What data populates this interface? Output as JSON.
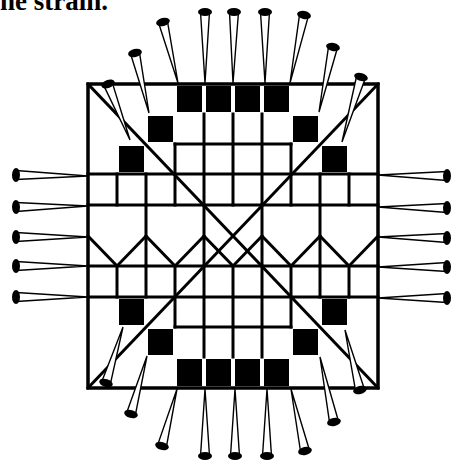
{
  "caption": {
    "text": "he strain."
  },
  "diagram": {
    "colors": {
      "line": "#000000",
      "fill": "#000000",
      "background": "#ffffff"
    },
    "outer": {
      "x0": 88,
      "y0": 84,
      "x1": 378,
      "y1": 388
    },
    "grid": {
      "cols_x": [
        88,
        117,
        146,
        175,
        204,
        233,
        262,
        291,
        320,
        349,
        378
      ],
      "rows_y": [
        84,
        114,
        144,
        174,
        205,
        236,
        266,
        297,
        327,
        357,
        388
      ]
    },
    "black_squares": [
      {
        "c": 3,
        "r": 0
      },
      {
        "c": 4,
        "r": 0
      },
      {
        "c": 5,
        "r": 0
      },
      {
        "c": 6,
        "r": 0
      },
      {
        "c": 2,
        "r": 1
      },
      {
        "c": 7,
        "r": 1
      },
      {
        "c": 1,
        "r": 2
      },
      {
        "c": 8,
        "r": 2
      },
      {
        "c": 1,
        "r": 7
      },
      {
        "c": 8,
        "r": 7
      },
      {
        "c": 2,
        "r": 8
      },
      {
        "c": 7,
        "r": 8
      },
      {
        "c": 3,
        "r": 9
      },
      {
        "c": 4,
        "r": 9
      },
      {
        "c": 5,
        "r": 9
      },
      {
        "c": 6,
        "r": 9
      }
    ],
    "segments": [
      [
        88,
        205,
        378,
        205
      ],
      [
        88,
        174,
        378,
        174
      ],
      [
        175,
        144,
        291,
        144
      ],
      [
        88,
        266,
        378,
        266
      ],
      [
        88,
        297,
        378,
        297
      ],
      [
        175,
        327,
        291,
        327
      ],
      [
        117,
        174,
        117,
        205
      ],
      [
        146,
        174,
        146,
        205
      ],
      [
        175,
        144,
        175,
        205
      ],
      [
        204,
        114,
        204,
        205
      ],
      [
        233,
        114,
        233,
        205
      ],
      [
        262,
        114,
        262,
        205
      ],
      [
        291,
        144,
        291,
        205
      ],
      [
        320,
        174,
        320,
        205
      ],
      [
        349,
        174,
        349,
        205
      ],
      [
        117,
        266,
        117,
        297
      ],
      [
        146,
        266,
        146,
        297
      ],
      [
        175,
        266,
        175,
        327
      ],
      [
        204,
        266,
        204,
        357
      ],
      [
        233,
        266,
        233,
        357
      ],
      [
        262,
        266,
        262,
        357
      ],
      [
        291,
        266,
        291,
        327
      ],
      [
        320,
        266,
        320,
        297
      ],
      [
        349,
        266,
        349,
        297
      ],
      [
        146,
        205,
        146,
        266
      ],
      [
        204,
        205,
        204,
        266
      ],
      [
        262,
        205,
        262,
        266
      ],
      [
        320,
        205,
        320,
        266
      ],
      [
        88,
        236,
        117,
        266
      ],
      [
        117,
        266,
        146,
        236
      ],
      [
        146,
        236,
        175,
        266
      ],
      [
        175,
        266,
        204,
        236
      ],
      [
        204,
        236,
        233,
        266
      ],
      [
        233,
        266,
        262,
        236
      ],
      [
        262,
        236,
        291,
        266
      ],
      [
        291,
        266,
        320,
        236
      ],
      [
        320,
        236,
        349,
        266
      ],
      [
        349,
        266,
        378,
        236
      ],
      [
        88,
        84,
        378,
        388
      ],
      [
        378,
        84,
        88,
        388
      ]
    ],
    "pins": {
      "top": [
        {
          "head": [
            108,
            84
          ],
          "tip": [
            130,
            140
          ]
        },
        {
          "head": [
            135,
            53
          ],
          "tip": [
            149,
            113
          ]
        },
        {
          "head": [
            163,
            22
          ],
          "tip": [
            178,
            83
          ]
        },
        {
          "head": [
            205,
            12
          ],
          "tip": [
            205,
            83
          ]
        },
        {
          "head": [
            234,
            12
          ],
          "tip": [
            233,
            83
          ]
        },
        {
          "head": [
            265,
            12
          ],
          "tip": [
            265,
            83
          ]
        },
        {
          "head": [
            304,
            15
          ],
          "tip": [
            290,
            83
          ]
        },
        {
          "head": [
            333,
            47
          ],
          "tip": [
            319,
            112
          ]
        },
        {
          "head": [
            361,
            77
          ],
          "tip": [
            342,
            142
          ]
        }
      ],
      "bottom": [
        {
          "head": [
            106,
            383
          ],
          "tip": [
            123,
            327
          ]
        },
        {
          "head": [
            131,
            414
          ],
          "tip": [
            147,
            356
          ]
        },
        {
          "head": [
            162,
            446
          ],
          "tip": [
            177,
            389
          ]
        },
        {
          "head": [
            205,
            456
          ],
          "tip": [
            205,
            389
          ]
        },
        {
          "head": [
            235,
            456
          ],
          "tip": [
            235,
            389
          ]
        },
        {
          "head": [
            267,
            456
          ],
          "tip": [
            267,
            389
          ]
        },
        {
          "head": [
            305,
            451
          ],
          "tip": [
            291,
            389
          ]
        },
        {
          "head": [
            334,
            422
          ],
          "tip": [
            320,
            357
          ]
        },
        {
          "head": [
            360,
            390
          ],
          "tip": [
            345,
            330
          ]
        }
      ],
      "left": [
        {
          "head": [
            16,
            175
          ],
          "tip": [
            88,
            176
          ]
        },
        {
          "head": [
            16,
            207
          ],
          "tip": [
            88,
            206
          ]
        },
        {
          "head": [
            16,
            237
          ],
          "tip": [
            88,
            237
          ]
        },
        {
          "head": [
            16,
            266
          ],
          "tip": [
            88,
            266
          ]
        },
        {
          "head": [
            16,
            297
          ],
          "tip": [
            88,
            297
          ]
        }
      ],
      "right": [
        {
          "head": [
            447,
            176
          ],
          "tip": [
            378,
            175
          ]
        },
        {
          "head": [
            447,
            208
          ],
          "tip": [
            378,
            207
          ]
        },
        {
          "head": [
            447,
            238
          ],
          "tip": [
            378,
            237
          ]
        },
        {
          "head": [
            447,
            267
          ],
          "tip": [
            378,
            267
          ]
        },
        {
          "head": [
            447,
            298
          ],
          "tip": [
            378,
            298
          ]
        }
      ]
    }
  }
}
